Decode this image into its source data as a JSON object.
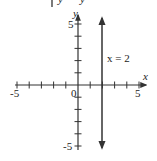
{
  "header_fragment": {
    "text": "y | y"
  },
  "chart_data": {
    "type": "line",
    "title": "",
    "xlabel": "x",
    "ylabel": "y",
    "xlim": [
      -5,
      5
    ],
    "ylim": [
      -5,
      5
    ],
    "x_tick_labels": [
      "-5",
      "0",
      "5"
    ],
    "y_tick_labels": [
      "5",
      "-5"
    ],
    "x_ticks": [
      -5,
      -4,
      -3,
      -2,
      -1,
      1,
      2,
      3,
      4,
      5
    ],
    "y_ticks": [
      -5,
      -4,
      -3,
      -2,
      -1,
      1,
      2,
      3,
      4,
      5
    ],
    "grid": false,
    "series": [
      {
        "name": "x = 2",
        "type": "vertical_line",
        "x": [
          2,
          2
        ],
        "y": [
          -5.1,
          5.6
        ],
        "arrows": "both"
      }
    ],
    "annotations": [
      {
        "text": "x = 2",
        "x": 2.4,
        "y": 2.3
      }
    ],
    "origin_label": "0"
  },
  "colors": {
    "axis": "#333333",
    "line": "#333333",
    "text": "#222222"
  }
}
